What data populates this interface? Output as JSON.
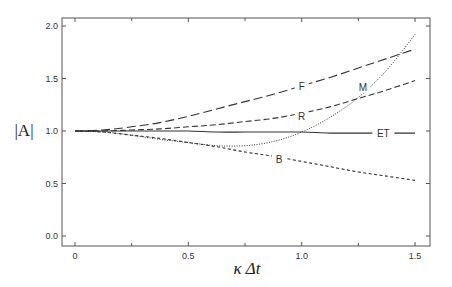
{
  "chart_data": {
    "type": "line",
    "title": "",
    "xlabel": "κ Δt",
    "ylabel": "|A|",
    "xlim": [
      -0.06,
      1.57
    ],
    "ylim": [
      -0.1,
      2.08
    ],
    "x_ticks": [
      0,
      0.5,
      1.0,
      1.5
    ],
    "x_tick_labels": [
      "0",
      "0.5",
      "1.0",
      "1.5"
    ],
    "x_minor_ticks": [
      0.25,
      0.75,
      1.25
    ],
    "y_ticks": [
      0.0,
      0.5,
      1.0,
      1.5,
      2.0
    ],
    "y_tick_labels": [
      "0.0",
      "0.5",
      "1.0",
      "1.5",
      "2.0"
    ],
    "grid": false,
    "legend": "inline labels",
    "x": [
      0,
      0.125,
      0.25,
      0.375,
      0.5,
      0.625,
      0.75,
      0.875,
      1.0,
      1.125,
      1.25,
      1.375,
      1.5
    ],
    "series": [
      {
        "name": "F",
        "style": "long-dash",
        "values": [
          1.0,
          1.01,
          1.04,
          1.08,
          1.14,
          1.21,
          1.28,
          1.35,
          1.43,
          1.51,
          1.6,
          1.69,
          1.78
        ],
        "label_at": [
          1.0,
          1.43
        ]
      },
      {
        "name": "M",
        "style": "dotted",
        "values": [
          1.0,
          0.99,
          0.96,
          0.92,
          0.89,
          0.86,
          0.86,
          0.9,
          0.99,
          1.13,
          1.32,
          1.58,
          1.92
        ],
        "label_at": [
          1.27,
          1.42
        ]
      },
      {
        "name": "R",
        "style": "dashed",
        "values": [
          1.0,
          1.0,
          1.01,
          1.02,
          1.04,
          1.06,
          1.09,
          1.12,
          1.17,
          1.23,
          1.31,
          1.39,
          1.48
        ],
        "label_at": [
          1.0,
          1.14
        ]
      },
      {
        "name": "ET",
        "style": "solid",
        "values": [
          1.0,
          1.0,
          1.0,
          1.0,
          1.0,
          0.99,
          0.99,
          0.99,
          0.99,
          0.98,
          0.98,
          0.98,
          0.98
        ],
        "label_at": [
          1.36,
          0.98
        ]
      },
      {
        "name": "B",
        "style": "short-dash",
        "values": [
          1.0,
          0.99,
          0.96,
          0.93,
          0.89,
          0.85,
          0.8,
          0.76,
          0.71,
          0.66,
          0.61,
          0.57,
          0.53
        ],
        "label_at": [
          0.9,
          0.73
        ]
      }
    ]
  },
  "colors": {
    "line": "#333333",
    "axis": "#555555",
    "background": "#ffffff"
  }
}
